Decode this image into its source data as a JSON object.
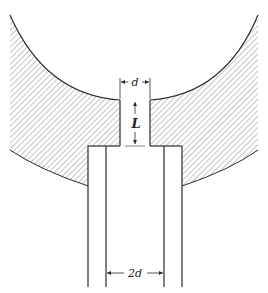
{
  "diagram": {
    "type": "nozzle-cross-section",
    "labels": {
      "d": "d",
      "L": "L",
      "two_d": "2d"
    },
    "colors": {
      "line": "#2a2a2a",
      "hatch": "#8a8a8a",
      "background": "#ffffff"
    }
  }
}
